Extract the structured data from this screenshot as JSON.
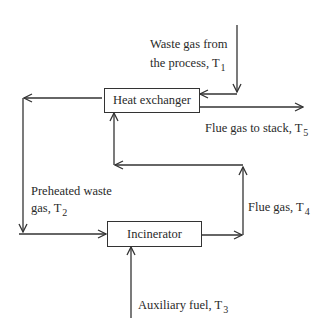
{
  "diagram": {
    "type": "process flow",
    "nodes": {
      "heat_exchanger": {
        "label": "Heat exchanger"
      },
      "incinerator": {
        "label": "Incinerator"
      }
    },
    "streams": {
      "waste_gas": {
        "text": "Waste gas from",
        "text2": "the process, T",
        "sub": "1"
      },
      "flue_stack": {
        "text": "Flue gas to stack, T",
        "sub": "5"
      },
      "preheated": {
        "text": "Preheated waste",
        "text2": "gas,  T",
        "sub": "2"
      },
      "flue_gas": {
        "text": "Flue gas, T",
        "sub": "4"
      },
      "aux_fuel": {
        "text": "Auxiliary fuel, T",
        "sub": "3"
      }
    },
    "edges": [
      {
        "from": "waste_gas_inlet",
        "to": "heat_exchanger",
        "label": "Waste gas from the process, T1"
      },
      {
        "from": "heat_exchanger",
        "to": "stack",
        "label": "Flue gas to stack, T5"
      },
      {
        "from": "heat_exchanger",
        "to": "incinerator",
        "label": "Preheated waste gas, T2"
      },
      {
        "from": "auxiliary_fuel",
        "to": "incinerator",
        "label": "Auxiliary fuel, T3"
      },
      {
        "from": "incinerator",
        "to": "heat_exchanger",
        "label": "Flue gas, T4"
      }
    ],
    "colors": {
      "line": "#333333",
      "text": "#2a2a2a",
      "background": "#ffffff"
    }
  }
}
